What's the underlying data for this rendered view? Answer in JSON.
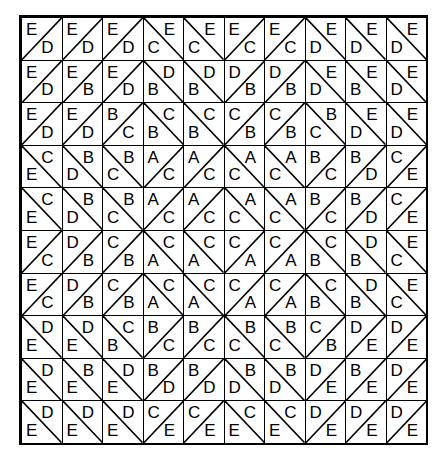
{
  "grid": {
    "rows": 10,
    "cols": 10,
    "cells": [
      [
        [
          "/",
          "E",
          "D"
        ],
        [
          "/",
          "E",
          "D"
        ],
        [
          "/",
          "E",
          "D"
        ],
        [
          "\\",
          "C",
          "E"
        ],
        [
          "\\",
          "C",
          "E"
        ],
        [
          "/",
          "E",
          "C"
        ],
        [
          "/",
          "E",
          "C"
        ],
        [
          "\\",
          "D",
          "E"
        ],
        [
          "\\",
          "D",
          "E"
        ],
        [
          "\\",
          "D",
          "E"
        ]
      ],
      [
        [
          "/",
          "E",
          "D"
        ],
        [
          "/",
          "E",
          "B"
        ],
        [
          "/",
          "E",
          "D"
        ],
        [
          "\\",
          "B",
          "D"
        ],
        [
          "\\",
          "B",
          "D"
        ],
        [
          "/",
          "D",
          "B"
        ],
        [
          "/",
          "D",
          "B"
        ],
        [
          "\\",
          "D",
          "E"
        ],
        [
          "\\",
          "B",
          "E"
        ],
        [
          "\\",
          "D",
          "E"
        ]
      ],
      [
        [
          "/",
          "E",
          "D"
        ],
        [
          "/",
          "E",
          "D"
        ],
        [
          "/",
          "B",
          "C"
        ],
        [
          "\\",
          "B",
          "C"
        ],
        [
          "\\",
          "B",
          "C"
        ],
        [
          "/",
          "C",
          "B"
        ],
        [
          "/",
          "C",
          "B"
        ],
        [
          "\\",
          "C",
          "B"
        ],
        [
          "\\",
          "D",
          "E"
        ],
        [
          "\\",
          "D",
          "E"
        ]
      ],
      [
        [
          "\\",
          "E",
          "C"
        ],
        [
          "\\",
          "D",
          "B"
        ],
        [
          "\\",
          "C",
          "B"
        ],
        [
          "/",
          "A",
          "C"
        ],
        [
          "/",
          "A",
          "C"
        ],
        [
          "\\",
          "C",
          "A"
        ],
        [
          "\\",
          "C",
          "A"
        ],
        [
          "/",
          "B",
          "C"
        ],
        [
          "/",
          "B",
          "D"
        ],
        [
          "/",
          "C",
          "E"
        ]
      ],
      [
        [
          "\\",
          "E",
          "C"
        ],
        [
          "\\",
          "D",
          "B"
        ],
        [
          "\\",
          "C",
          "B"
        ],
        [
          "/",
          "A",
          "C"
        ],
        [
          "/",
          "A",
          "C"
        ],
        [
          "\\",
          "C",
          "A"
        ],
        [
          "\\",
          "C",
          "A"
        ],
        [
          "/",
          "B",
          "C"
        ],
        [
          "/",
          "B",
          "D"
        ],
        [
          "/",
          "C",
          "E"
        ]
      ],
      [
        [
          "/",
          "E",
          "C"
        ],
        [
          "/",
          "D",
          "B"
        ],
        [
          "/",
          "C",
          "B"
        ],
        [
          "\\",
          "A",
          "C"
        ],
        [
          "\\",
          "A",
          "C"
        ],
        [
          "/",
          "C",
          "A"
        ],
        [
          "/",
          "C",
          "A"
        ],
        [
          "\\",
          "B",
          "C"
        ],
        [
          "\\",
          "B",
          "D"
        ],
        [
          "\\",
          "C",
          "E"
        ]
      ],
      [
        [
          "/",
          "E",
          "C"
        ],
        [
          "/",
          "D",
          "B"
        ],
        [
          "/",
          "C",
          "B"
        ],
        [
          "\\",
          "A",
          "C"
        ],
        [
          "\\",
          "A",
          "C"
        ],
        [
          "/",
          "C",
          "A"
        ],
        [
          "/",
          "C",
          "A"
        ],
        [
          "\\",
          "B",
          "C"
        ],
        [
          "\\",
          "B",
          "D"
        ],
        [
          "\\",
          "C",
          "E"
        ]
      ],
      [
        [
          "\\",
          "E",
          "D"
        ],
        [
          "\\",
          "E",
          "D"
        ],
        [
          "\\",
          "B",
          "C"
        ],
        [
          "/",
          "B",
          "C"
        ],
        [
          "/",
          "B",
          "C"
        ],
        [
          "\\",
          "C",
          "B"
        ],
        [
          "\\",
          "C",
          "B"
        ],
        [
          "/",
          "C",
          "B"
        ],
        [
          "/",
          "D",
          "E"
        ],
        [
          "/",
          "D",
          "E"
        ]
      ],
      [
        [
          "\\",
          "E",
          "D"
        ],
        [
          "\\",
          "E",
          "B"
        ],
        [
          "\\",
          "E",
          "D"
        ],
        [
          "/",
          "B",
          "D"
        ],
        [
          "/",
          "B",
          "D"
        ],
        [
          "\\",
          "D",
          "B"
        ],
        [
          "\\",
          "D",
          "B"
        ],
        [
          "/",
          "D",
          "E"
        ],
        [
          "/",
          "B",
          "E"
        ],
        [
          "/",
          "D",
          "E"
        ]
      ],
      [
        [
          "\\",
          "E",
          "D"
        ],
        [
          "\\",
          "E",
          "D"
        ],
        [
          "\\",
          "E",
          "D"
        ],
        [
          "/",
          "C",
          "E"
        ],
        [
          "/",
          "C",
          "E"
        ],
        [
          "\\",
          "E",
          "C"
        ],
        [
          "\\",
          "E",
          "C"
        ],
        [
          "/",
          "D",
          "E"
        ],
        [
          "/",
          "D",
          "E"
        ],
        [
          "/",
          "D",
          "E"
        ]
      ]
    ],
    "legend": {
      "/": "diagonal from bottom-left to top-right; first letter top-left, second letter bottom-right",
      "\\": "diagonal from top-left to bottom-right; first letter bottom-left, second letter top-right"
    }
  }
}
